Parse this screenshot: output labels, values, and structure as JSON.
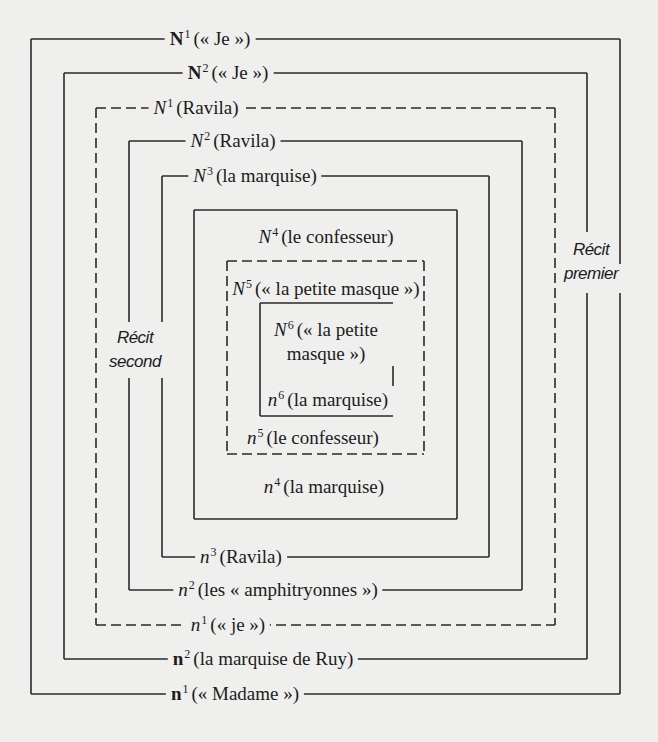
{
  "diagram": {
    "type": "nested-narrative-frames",
    "side_labels": {
      "recit_premier": [
        "Récit",
        "premier"
      ],
      "recit_second": [
        "Récit",
        "second"
      ]
    },
    "frames": [
      {
        "level": 1,
        "style": "solid",
        "top": {
          "sym": "N",
          "sup": "1",
          "bold": true,
          "text": "(« Je »)"
        },
        "bottom": {
          "sym": "n",
          "sup": "1",
          "bold": true,
          "text": "(« Madame »)"
        }
      },
      {
        "level": 2,
        "style": "solid",
        "top": {
          "sym": "N",
          "sup": "2",
          "bold": true,
          "text": "(« Je »)"
        },
        "bottom": {
          "sym": "n",
          "sup": "2",
          "bold": true,
          "text": "(la marquise de Ruy)"
        }
      },
      {
        "level": 3,
        "style": "dashed",
        "top": {
          "sym": "N",
          "sup": "1",
          "bold": false,
          "text": "(Ravila)"
        },
        "bottom": {
          "sym": "n",
          "sup": "1",
          "bold": false,
          "text": "(« je »)"
        }
      },
      {
        "level": 4,
        "style": "solid",
        "top": {
          "sym": "N",
          "sup": "2",
          "bold": false,
          "text": "(Ravila)"
        },
        "bottom": {
          "sym": "n",
          "sup": "2",
          "bold": false,
          "text": "(les « amphitryonnes »)"
        }
      },
      {
        "level": 5,
        "style": "solid",
        "top": {
          "sym": "N",
          "sup": "3",
          "bold": false,
          "text": "(la marquise)"
        },
        "bottom": {
          "sym": "n",
          "sup": "3",
          "bold": false,
          "text": "(Ravila)"
        }
      },
      {
        "level": 6,
        "style": "solid",
        "top": {
          "sym": "N",
          "sup": "4",
          "bold": false,
          "text": "(le confesseur)"
        },
        "bottom": {
          "sym": "n",
          "sup": "4",
          "bold": false,
          "text": "(la marquise)"
        }
      },
      {
        "level": 7,
        "style": "dashed",
        "top": {
          "sym": "N",
          "sup": "5",
          "bold": false,
          "text": "(« la petite masque »)"
        },
        "bottom": {
          "sym": "n",
          "sup": "5",
          "bold": false,
          "text": "(le confesseur)"
        }
      },
      {
        "level": 8,
        "style": "solid",
        "top": {
          "sym": "N",
          "sup": "6",
          "bold": false,
          "text": "(« la petite masque »)"
        },
        "bottom": {
          "sym": "n",
          "sup": "6",
          "bold": false,
          "text": "(la marquise)"
        }
      }
    ]
  }
}
